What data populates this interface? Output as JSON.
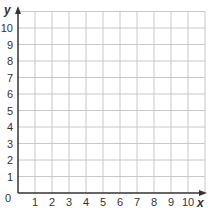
{
  "graph": {
    "x_axis_label": "x",
    "y_axis_label": "y",
    "origin_label": "0",
    "x_ticks": [
      "1",
      "2",
      "3",
      "4",
      "5",
      "6",
      "7",
      "8",
      "9",
      "10"
    ],
    "y_ticks": [
      "1",
      "2",
      "3",
      "4",
      "5",
      "6",
      "7",
      "8",
      "9",
      "10"
    ],
    "grid_cells_x": 11,
    "grid_cells_y": 11,
    "colors": {
      "grid": "#c8c8c8",
      "axis": "#333333",
      "text": "#333333",
      "background": "#ffffff"
    }
  }
}
